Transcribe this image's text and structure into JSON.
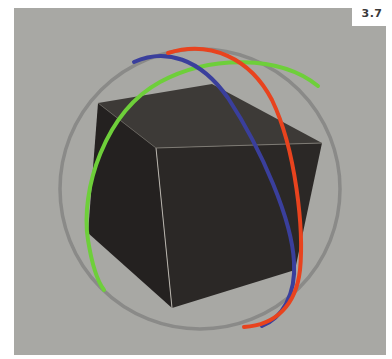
{
  "figure": {
    "label": "3.7"
  },
  "scene": {
    "background_color": "#a8a8a4",
    "object": "cube",
    "cube_colors": {
      "top": "#3d3a37",
      "left": "#252220",
      "right": "#2c2927",
      "edge_highlight": "#b9b5ae"
    },
    "gizmo": {
      "type": "rotate-gizmo",
      "rings": [
        {
          "axis": "screen",
          "color": "#8a8a88"
        },
        {
          "axis": "x",
          "color": "#e8431e"
        },
        {
          "axis": "y",
          "color": "#6ecf3a"
        },
        {
          "axis": "z",
          "color": "#3a3f9c"
        }
      ]
    }
  }
}
